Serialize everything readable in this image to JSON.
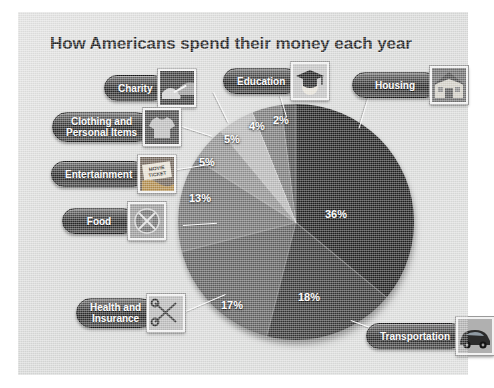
{
  "page": {
    "title": "How Americans spend their money each year",
    "background_color": "#dddedd",
    "panel_border_color": "#ffffff",
    "title_color": "#1b1b1b"
  },
  "chart_data": {
    "type": "pie",
    "title": "How Americans spend their money each year",
    "xlabel": "",
    "ylabel": "",
    "unit": "percent",
    "total": 100,
    "start_angle_deg": 0,
    "direction": "clockwise",
    "legend_position": "callouts",
    "grid": false,
    "categories": [
      "Housing",
      "Transportation",
      "Health and Insurance",
      "Food",
      "Entertainment",
      "Clothing and Personal Items",
      "Charity",
      "Education"
    ],
    "values": [
      36,
      18,
      17,
      13,
      5,
      5,
      4,
      2
    ],
    "labels": [
      "36%",
      "18%",
      "17%",
      "13%",
      "5%",
      "5%",
      "4%",
      "2%"
    ],
    "colors": [
      "#1d1d1d",
      "#333333",
      "#5c5c5c",
      "#707070",
      "#8f8f8f",
      "#b6b6b6",
      "#787878",
      "#4a4a4a"
    ],
    "slices": [
      {
        "name": "Housing",
        "value": 36,
        "label": "36%",
        "color": "#1d1d1d",
        "icon": "house-icon"
      },
      {
        "name": "Transportation",
        "value": 18,
        "label": "18%",
        "color": "#333333",
        "icon": "car-icon"
      },
      {
        "name": "Health and Insurance",
        "value": 17,
        "label": "17%",
        "color": "#5c5c5c",
        "icon": "scissors-icon"
      },
      {
        "name": "Food",
        "value": 13,
        "label": "13%",
        "color": "#707070",
        "icon": "plate-icon"
      },
      {
        "name": "Entertainment",
        "value": 5,
        "label": "5%",
        "color": "#8f8f8f",
        "icon": "movie-ticket-icon"
      },
      {
        "name": "Clothing and Personal Items",
        "value": 5,
        "label": "5%",
        "color": "#b6b6b6",
        "icon": "tshirt-icon"
      },
      {
        "name": "Charity",
        "value": 4,
        "label": "4%",
        "color": "#787878",
        "icon": "helping-hands-icon"
      },
      {
        "name": "Education",
        "value": 2,
        "label": "2%",
        "color": "#4a4a4a",
        "icon": "graduation-cap-icon"
      }
    ]
  },
  "callouts": {
    "charity": {
      "label": "Charity",
      "icon": "helping-hands-icon"
    },
    "clothing": {
      "label": "Clothing and\nPersonal Items",
      "icon": "tshirt-icon"
    },
    "entertainment": {
      "label": "Entertainment",
      "icon": "movie-ticket-icon"
    },
    "food": {
      "label": "Food",
      "icon": "plate-icon"
    },
    "health": {
      "label": "Health and\nInsurance",
      "icon": "scissors-icon"
    },
    "education": {
      "label": "Education",
      "icon": "graduation-cap-icon"
    },
    "housing": {
      "label": "Housing",
      "icon": "house-icon"
    },
    "transportation": {
      "label": "Transportation",
      "icon": "car-icon"
    }
  },
  "percent_labels": {
    "housing": "36%",
    "transportation": "18%",
    "health": "17%",
    "food": "13%",
    "entertainment": "5%",
    "clothing": "5%",
    "charity": "4%",
    "education": "2%"
  }
}
